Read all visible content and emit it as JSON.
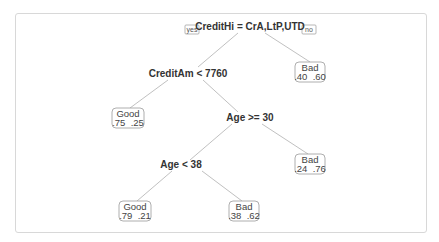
{
  "tree": {
    "branch_labels": {
      "yes": "yes",
      "no": "no"
    },
    "nodes": [
      {
        "id": "root",
        "type": "split",
        "label": "CreditHi = CrA,LtP,UTD"
      },
      {
        "id": "n2",
        "type": "split",
        "label": "CreditAm < 7760"
      },
      {
        "id": "n3",
        "type": "leaf",
        "class": "Bad",
        "probs": ".40  .60"
      },
      {
        "id": "n4",
        "type": "leaf",
        "class": "Good",
        "probs": ".75  .25"
      },
      {
        "id": "n5",
        "type": "split",
        "label": "Age >= 30"
      },
      {
        "id": "n6",
        "type": "split",
        "label": "Age < 38"
      },
      {
        "id": "n7",
        "type": "leaf",
        "class": "Bad",
        "probs": ".24  .76"
      },
      {
        "id": "n8",
        "type": "leaf",
        "class": "Good",
        "probs": ".79  .21"
      },
      {
        "id": "n9",
        "type": "leaf",
        "class": "Bad",
        "probs": ".38  .62"
      }
    ],
    "edges": [
      [
        "root",
        "n2"
      ],
      [
        "root",
        "n3"
      ],
      [
        "n2",
        "n4"
      ],
      [
        "n2",
        "n5"
      ],
      [
        "n5",
        "n6"
      ],
      [
        "n5",
        "n7"
      ],
      [
        "n6",
        "n8"
      ],
      [
        "n6",
        "n9"
      ]
    ]
  }
}
